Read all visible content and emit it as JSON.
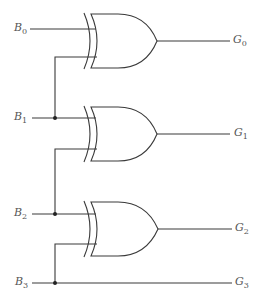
{
  "diagram": {
    "inputs": [
      {
        "name": "B",
        "sub": "0"
      },
      {
        "name": "B",
        "sub": "1"
      },
      {
        "name": "B",
        "sub": "2"
      },
      {
        "name": "B",
        "sub": "3"
      }
    ],
    "outputs": [
      {
        "name": "G",
        "sub": "0"
      },
      {
        "name": "G",
        "sub": "1"
      },
      {
        "name": "G",
        "sub": "2"
      },
      {
        "name": "G",
        "sub": "3"
      }
    ],
    "gates": [
      {
        "type": "XOR",
        "inputs": [
          "B0",
          "B1"
        ],
        "output": "G0"
      },
      {
        "type": "XOR",
        "inputs": [
          "B1",
          "B2"
        ],
        "output": "G1"
      },
      {
        "type": "XOR",
        "inputs": [
          "B2",
          "B3"
        ],
        "output": "G2"
      }
    ],
    "passthrough": {
      "input": "B3",
      "output": "G3"
    }
  }
}
